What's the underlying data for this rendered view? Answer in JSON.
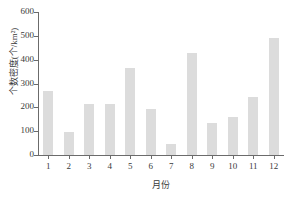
{
  "chart_data": {
    "type": "bar",
    "title": "",
    "xlabel": "月份",
    "ylabel": "个数密度(个/km²)",
    "categories": [
      "1",
      "2",
      "3",
      "4",
      "5",
      "6",
      "7",
      "8",
      "9",
      "10",
      "11",
      "12"
    ],
    "values": [
      270,
      95,
      215,
      215,
      365,
      195,
      45,
      430,
      135,
      160,
      245,
      490
    ],
    "ylim": [
      0,
      600
    ],
    "yticks": [
      0,
      100,
      200,
      300,
      400,
      500,
      600
    ],
    "ytick_labels": [
      "0",
      "100",
      "200",
      "300",
      "400",
      "500",
      "600"
    ],
    "grid": false,
    "legend": null,
    "bar_color": "#dcdcdc",
    "axis_color": "#6b6b6b",
    "text_color": "#3a3a3a",
    "background": "#ffffff"
  }
}
